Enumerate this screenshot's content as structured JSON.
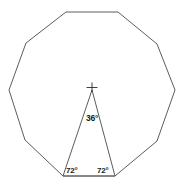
{
  "figure": {
    "background_color": "#ffffff",
    "stroke_color": "#4a4a4a",
    "base_stroke_color": "#7a7a7a",
    "label_color": "#1a1a1a",
    "center_marker": "plus-cross-marker",
    "labels": {
      "apex_angle": "36°",
      "base_angle_left": "72°",
      "base_angle_right": "72°"
    }
  },
  "chart_data": {
    "type": "diagram",
    "shape": "regular-decagon",
    "sides": 10,
    "center": {
      "x": 92,
      "y": 90
    },
    "circumradius": 83,
    "rotation_deg": 18,
    "vertices": [
      {
        "x": 66,
        "y": 12
      },
      {
        "x": 118,
        "y": 12
      },
      {
        "x": 157,
        "y": 44
      },
      {
        "x": 175,
        "y": 90
      },
      {
        "x": 157,
        "y": 141
      },
      {
        "x": 115,
        "y": 176
      },
      {
        "x": 63,
        "y": 176
      },
      {
        "x": 25,
        "y": 140
      },
      {
        "x": 9,
        "y": 90
      },
      {
        "x": 26,
        "y": 43
      }
    ],
    "triangle": {
      "apex": {
        "x": 92,
        "y": 90
      },
      "base_left": {
        "x": 63,
        "y": 176
      },
      "base_right": {
        "x": 115,
        "y": 176
      },
      "apex_angle_deg": 36,
      "base_angle_left_deg": 72,
      "base_angle_right_deg": 72
    },
    "annotations": [
      {
        "text": "36°",
        "x": 92,
        "y": 118,
        "refers_to": "apex-angle"
      },
      {
        "text": "72°",
        "x": 72,
        "y": 171,
        "refers_to": "base-angle-left"
      },
      {
        "text": "72°",
        "x": 103,
        "y": 171,
        "refers_to": "base-angle-right"
      }
    ]
  }
}
